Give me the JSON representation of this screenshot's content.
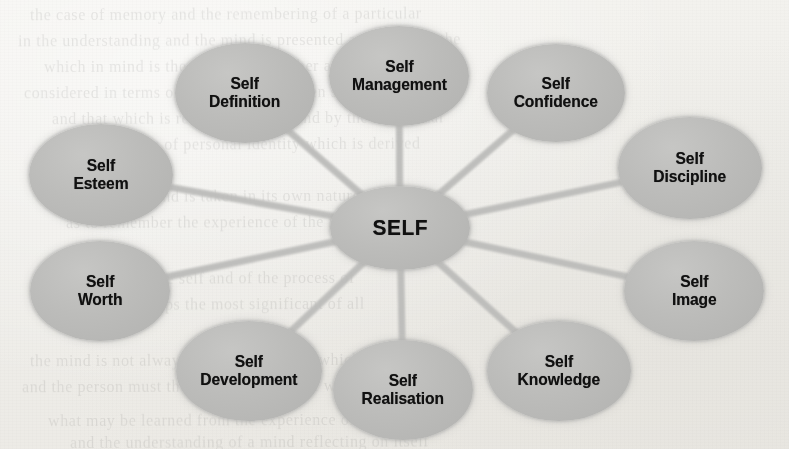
{
  "page": {
    "background_color": "#f1f0ec",
    "node_fill_color": "#b8b8b8",
    "node_text_color": "#101010",
    "spoke_color": "#b9b9b7"
  },
  "diagram": {
    "type": "radial-spoke",
    "center": {
      "label": "SELF",
      "cx": 400,
      "cy": 228,
      "rx": 70,
      "ry": 42
    },
    "satellites": [
      {
        "label_line1": "Self",
        "label_line2": "Management",
        "label": "Self Management",
        "cx": 399,
        "cy": 76,
        "rx": 70,
        "ry": 50
      },
      {
        "label_line1": "Self",
        "label_line2": "Confidence",
        "label": "Self Confidence",
        "cx": 556,
        "cy": 93,
        "rx": 69,
        "ry": 49
      },
      {
        "label_line1": "Self",
        "label_line2": "Discipline",
        "label": "Self Discipline",
        "cx": 690,
        "cy": 168,
        "rx": 72,
        "ry": 51
      },
      {
        "label_line1": "Self",
        "label_line2": "Image",
        "label": "Self Image",
        "cx": 694,
        "cy": 291,
        "rx": 70,
        "ry": 50
      },
      {
        "label_line1": "Self",
        "label_line2": "Knowledge",
        "label": "Self Knowledge",
        "cx": 559,
        "cy": 371,
        "rx": 72,
        "ry": 50
      },
      {
        "label_line1": "Self",
        "label_line2": "Realisation",
        "label": "Self Realisation",
        "cx": 403,
        "cy": 390,
        "rx": 70,
        "ry": 50
      },
      {
        "label_line1": "Self",
        "label_line2": "Development",
        "label": "Self Development",
        "cx": 249,
        "cy": 371,
        "rx": 73,
        "ry": 50
      },
      {
        "label_line1": "Self",
        "label_line2": "Worth",
        "label": "Self Worth",
        "cx": 100,
        "cy": 291,
        "rx": 70,
        "ry": 50
      },
      {
        "label_line1": "Self",
        "label_line2": "Esteem",
        "label": "Self Esteem",
        "cx": 101,
        "cy": 175,
        "rx": 72,
        "ry": 51
      },
      {
        "label_line1": "Self",
        "label_line2": "Definition",
        "label": "Self Definition",
        "cx": 245,
        "cy": 93,
        "rx": 70,
        "ry": 50
      }
    ]
  },
  "background_bleed": {
    "note": "faint illegible show-through text from reverse of scanned page",
    "lines": [
      {
        "top": 4,
        "text": "the case of memory and the remembering of a particular",
        "indent": 30
      },
      {
        "top": 30,
        "text": "in the understanding and the mind is presented according to the",
        "indent": 18
      },
      {
        "top": 56,
        "text": "which in mind is the mind to remember and reflect upon",
        "indent": 44
      },
      {
        "top": 82,
        "text": "considered in terms of the relation between self knowledge",
        "indent": 24
      },
      {
        "top": 108,
        "text": "and that which is recorded in the mind by the individual",
        "indent": 52
      },
      {
        "top": 134,
        "text": "the sense of personal identity which is derived",
        "indent": 96
      },
      {
        "top": 186,
        "text": "the further the mind is taken in its own nature",
        "indent": 40
      },
      {
        "top": 212,
        "text": "as to remember the experience of the mind in its",
        "indent": 66
      },
      {
        "top": 268,
        "text": "awareness of the self and of the process of",
        "indent": 58
      },
      {
        "top": 294,
        "text": "is perhaps the most significant of all",
        "indent": 110
      },
      {
        "top": 350,
        "text": "the mind is not always able to recall that which is",
        "indent": 30
      },
      {
        "top": 376,
        "text": "and the person must therefore consider the way in which",
        "indent": 22
      },
      {
        "top": 410,
        "text": "what may be learned from the experience of the self",
        "indent": 48
      },
      {
        "top": 432,
        "text": "and the understanding of a mind reflecting on itself",
        "indent": 70
      }
    ]
  }
}
